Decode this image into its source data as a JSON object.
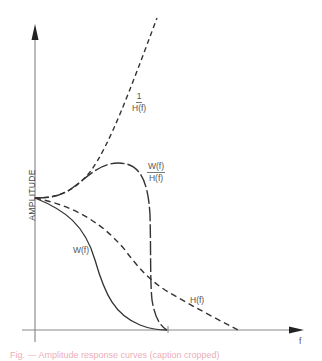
{
  "figure": {
    "y_axis_label": "AMPLITUDE",
    "x_axis_label": "f",
    "curves": [
      {
        "id": "inverse_h",
        "label_num": "1",
        "label_den": "H(f)",
        "style": "dashed",
        "description": "1/H(f) rises steeply with frequency"
      },
      {
        "id": "w_over_h",
        "label_num": "W(f)",
        "label_den": "H(f)",
        "style": "long-dash",
        "description": "W(f)/H(f) peaks then drops sharply to zero"
      },
      {
        "id": "h",
        "label": "H(f)",
        "style": "dashed",
        "description": "H(f) decays gradually to zero"
      },
      {
        "id": "w",
        "label": "W(f)",
        "style": "solid",
        "description": "W(f) decays to zero at cutoff"
      }
    ],
    "colors": {
      "axis": "#666666",
      "curve": "#333333",
      "label": "#555555"
    }
  },
  "caption": {
    "text": "Fig. — Amplitude response curves (caption cropped)"
  }
}
